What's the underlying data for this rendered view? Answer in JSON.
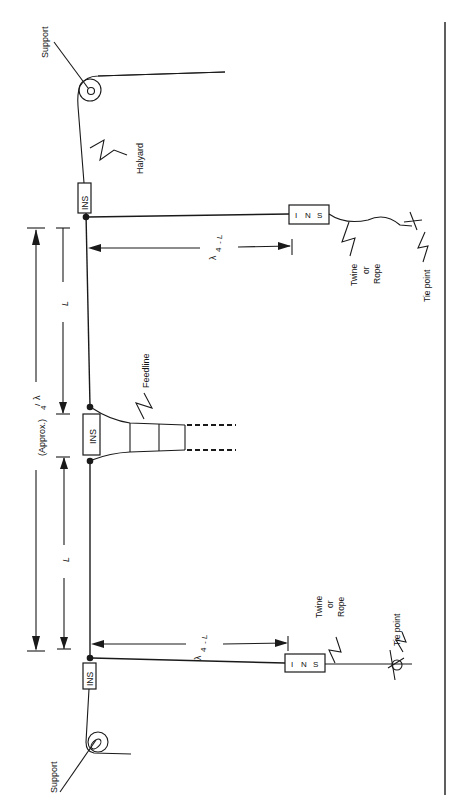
{
  "diagram": {
    "orientation": "rotated 90deg counter-clockwise",
    "labels": {
      "support_top": "Support",
      "support_bottom": "Support",
      "halyard": "Halyard",
      "feedline": "Feedline",
      "insulator": "INS",
      "insulator_vertical_top": "INS",
      "insulator_vertical_bottom": "INS",
      "twine_top_l1": "Twine",
      "twine_top_l2": "or",
      "twine_top_l3": "Rope",
      "twine_bottom_l1": "Twine",
      "twine_bottom_l2": "or",
      "twine_bottom_l3": "Rope",
      "tie_point_top": "Tie point",
      "tie_point_bottom": "Tie point",
      "dim_L_top": "L",
      "dim_L_bottom": "L",
      "dim_lambda_sym": "λ",
      "dim_lambda_div": "/",
      "dim_lambda_4": "4",
      "dim_lambda_approx": "(Approx.)",
      "dim_quarter_minus_L": "- L"
    },
    "colors": {
      "line": "#1a1a1a",
      "background": "#ffffff"
    }
  }
}
